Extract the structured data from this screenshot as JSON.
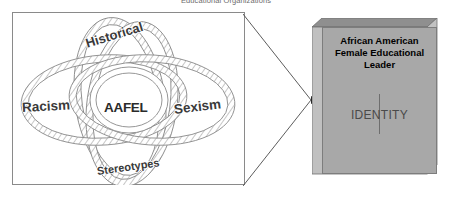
{
  "caption": {
    "text": "Educational Organizations"
  },
  "venn": {
    "title": "Intersecting influences on AAFEL identity",
    "circles": [
      {
        "id": "historical",
        "label": "Historical",
        "position": "top"
      },
      {
        "id": "racism",
        "label": "Racism",
        "position": "left"
      },
      {
        "id": "sexism",
        "label": "Sexism",
        "position": "right"
      },
      {
        "id": "stereotypes",
        "label": "Stereotypes",
        "position": "bottom"
      }
    ],
    "center": {
      "id": "aafel",
      "label": "AAFEL"
    },
    "fill_pattern": "diagonal-hatch",
    "stroke_color": "#8a8a8a",
    "frame_color": "#8a8a8a"
  },
  "connector": {
    "type": "converging-arrow",
    "direction": "left-to-right",
    "arrowhead": "filled"
  },
  "identity_box": {
    "title": "African American Female Educational Leader",
    "title_lines": [
      "African American",
      "Female Educational",
      "Leader"
    ],
    "body_label": "IDENTITY",
    "face_color": "#a8a8a8",
    "side_color": "#c0c0c0",
    "top_color": "#8f8f8f",
    "edge_color": "#7d7d7d",
    "shape": "3d-cube"
  }
}
